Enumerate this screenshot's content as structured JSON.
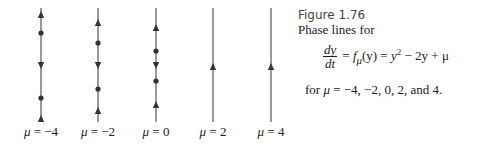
{
  "figure": {
    "title": "Figure 1.76",
    "subtitle": "Phase lines for",
    "equation": {
      "lhs_numerator": "dy",
      "lhs_denominator": "dt",
      "rhs": "= fμ(y) = y² − 2y + μ",
      "rhs_parts": {
        "eq1": "=",
        "f": "f",
        "f_sub": "μ",
        "arg": "(y)",
        "eq2": "=",
        "y": "y",
        "exp": "2",
        "rest": "− 2y + μ"
      }
    },
    "for_line": {
      "prefix": "for",
      "mu": "μ",
      "rest": "= −4, −2, 0, 2, and 4."
    }
  },
  "phase_lines": [
    {
      "mu_symbol": "μ",
      "label": "= −4",
      "mu": -4,
      "x": 41,
      "markers": [
        {
          "type": "arrow-up",
          "y": 15
        },
        {
          "type": "dot",
          "y": 33
        },
        {
          "type": "arrow-down",
          "y": 65
        },
        {
          "type": "dot",
          "y": 98
        },
        {
          "type": "arrow-up",
          "y": 119
        }
      ]
    },
    {
      "mu_symbol": "μ",
      "label": "= −2",
      "mu": -2,
      "x": 98,
      "markers": [
        {
          "type": "arrow-up",
          "y": 23
        },
        {
          "type": "dot",
          "y": 43
        },
        {
          "type": "arrow-down",
          "y": 65
        },
        {
          "type": "dot",
          "y": 89
        },
        {
          "type": "arrow-up",
          "y": 111
        }
      ]
    },
    {
      "mu_symbol": "μ",
      "label": "= 0",
      "mu": 0,
      "x": 156,
      "markers": [
        {
          "type": "arrow-up",
          "y": 28
        },
        {
          "type": "dot",
          "y": 51
        },
        {
          "type": "arrow-down",
          "y": 65
        },
        {
          "type": "dot",
          "y": 81
        },
        {
          "type": "arrow-up",
          "y": 105
        }
      ]
    },
    {
      "mu_symbol": "μ",
      "label": "= 2",
      "mu": 2,
      "x": 213,
      "markers": [
        {
          "type": "arrow-up",
          "y": 67
        }
      ]
    },
    {
      "mu_symbol": "μ",
      "label": "= 4",
      "mu": 4,
      "x": 271,
      "markers": [
        {
          "type": "arrow-up",
          "y": 67
        }
      ]
    }
  ],
  "style": {
    "line_color": "#555555",
    "marker_color": "#333333",
    "line_top": 8,
    "line_bottom": 122
  }
}
